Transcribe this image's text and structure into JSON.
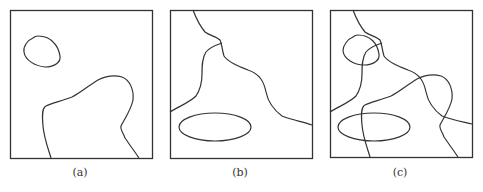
{
  "figure": {
    "panels": [
      {
        "id": "a",
        "label": "(a)",
        "shapes": [
          "small-closed-loop-top-left",
          "mountain-shaped-curve-from-bottom"
        ]
      },
      {
        "id": "b",
        "label": "(b)",
        "shapes": [
          "curve-from-top-to-right-edge",
          "branch-to-left-edge",
          "ellipse-bottom-left"
        ]
      },
      {
        "id": "c",
        "label": "(c)",
        "shapes": [
          "overlay of (a) and (b)"
        ]
      }
    ],
    "stroke_color": "#333333",
    "frame_color": "#333333"
  }
}
